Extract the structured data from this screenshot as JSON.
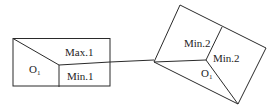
{
  "diagram": {
    "type": "two linked polygonal regions",
    "stroke_color": "#2a2a2a",
    "background": "#ffffff",
    "left_region": {
      "center_label": "O",
      "center_subscript": "1",
      "upper_label": "Max.1",
      "lower_label": "Min.1"
    },
    "right_region": {
      "center_label": "O",
      "center_subscript": "1",
      "upper_left_label": "Min.2",
      "right_label": "Min.2"
    },
    "connector": "line joining left rectangle to right quadrilateral"
  }
}
